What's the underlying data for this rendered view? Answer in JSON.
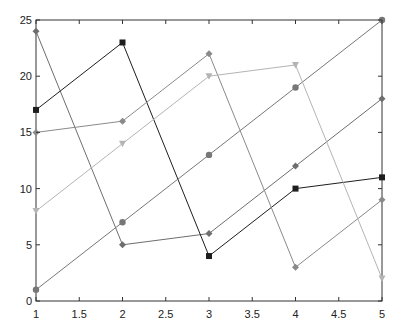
{
  "chart_data": {
    "type": "line",
    "title": "",
    "xlabel": "",
    "ylabel": "",
    "xlim": [
      1,
      5
    ],
    "ylim": [
      0,
      25
    ],
    "grid": false,
    "legend": null,
    "x": [
      1,
      2,
      3,
      4,
      5
    ],
    "x_ticks": [
      "1",
      "1.5",
      "2",
      "2.5",
      "3",
      "3.5",
      "4",
      "4.5",
      "5"
    ],
    "y_ticks": [
      "0",
      "5",
      "10",
      "15",
      "20",
      "25"
    ],
    "series": [
      {
        "name": "series-1",
        "values": [
          24,
          5,
          6,
          12,
          18
        ],
        "color": "#6e6e6e",
        "marker": "diamond"
      },
      {
        "name": "series-2",
        "values": [
          17,
          23,
          4,
          10,
          11
        ],
        "color": "#1e1e1e",
        "marker": "square"
      },
      {
        "name": "series-3",
        "values": [
          1,
          7,
          13,
          19,
          25
        ],
        "color": "#777777",
        "marker": "circle"
      },
      {
        "name": "series-4",
        "values": [
          15,
          16,
          22,
          3,
          9
        ],
        "color": "#8a8a8a",
        "marker": "diamond"
      },
      {
        "name": "series-5",
        "values": [
          8,
          14,
          20,
          21,
          2
        ],
        "color": "#b4b4b4",
        "marker": "triangle"
      }
    ]
  }
}
